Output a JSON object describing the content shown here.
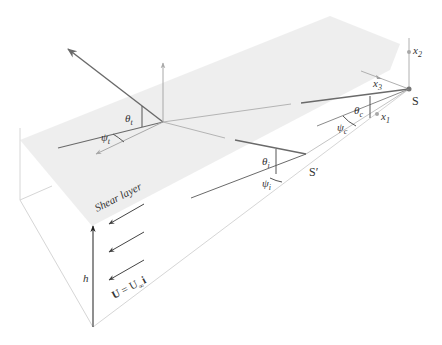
{
  "figure": {
    "type": "3D geometry diagram of acoustic propagation from a source above a sheared flow layer",
    "colors": {
      "background": "#ffffff",
      "plane_fill": "#ececec",
      "box_line": "#d4d4d4",
      "ray_dark": "#6a6a6a",
      "ray_light": "#a8a8a8",
      "axis": "#a0a0a0",
      "text": "#333333",
      "flow_arrow": "#555555",
      "h_arrow": "#333333"
    }
  },
  "labels": {
    "source": "S",
    "image_source": "S′",
    "x1": "x",
    "x1_sub": "1",
    "x2": "x",
    "x2_sub": "2",
    "x3": "x",
    "x3_sub": "3",
    "theta_c": "θ",
    "theta_c_sub": "c",
    "psi_c": "ψ",
    "psi_c_sub": "c",
    "theta_i": "θ",
    "theta_i_sub": "i",
    "psi_i": "ψ",
    "psi_i_sub": "i",
    "theta_t": "θ",
    "theta_t_sub": "t",
    "psi_t": "ψ",
    "psi_t_sub": "t",
    "shear_layer": "Shear layer",
    "height": "h",
    "velocity_lhs": "U",
    "velocity_eq": " = U",
    "velocity_sub": "∞",
    "velocity_unit": "i"
  }
}
